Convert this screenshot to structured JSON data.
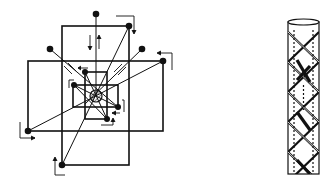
{
  "figures": [
    {
      "id": "left",
      "description": "Nested square frames with radial bracing lines from center to corner nodes, with directional arrows",
      "stroke_color": "#111111",
      "background": "#ffffff"
    },
    {
      "id": "right",
      "description": "Cylindrical column with crossing helical/diagonal bracing bands",
      "stroke_color": "#111111",
      "background": "#ffffff"
    }
  ]
}
